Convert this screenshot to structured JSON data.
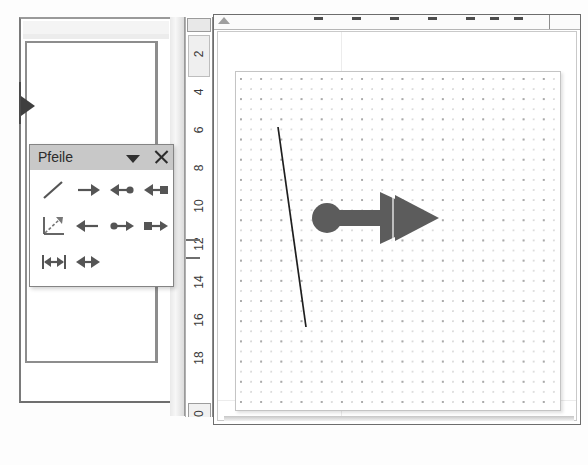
{
  "app": {
    "name": "drawing-application",
    "language": "de"
  },
  "toolbar": {
    "title": "Pfeile",
    "menu_icon": "chevron-down-icon",
    "close_icon": "close-icon",
    "rows": [
      [
        {
          "name": "line",
          "label": "Linie",
          "icon": "line-icon"
        },
        {
          "name": "arrow-right",
          "label": "Pfeil rechts",
          "icon": "arrow-right-icon"
        },
        {
          "name": "arrow-left-circle",
          "label": "Pfeil links mit Kreis",
          "icon": "arrow-left-circle-icon"
        },
        {
          "name": "arrow-left-square",
          "label": "Pfeil links mit Quadrat",
          "icon": "arrow-left-square-icon"
        }
      ],
      [
        {
          "name": "dimension-axis-arrow",
          "label": "Masslinie",
          "icon": "axis-arrow-icon"
        },
        {
          "name": "arrow-left",
          "label": "Pfeil links",
          "icon": "arrow-left-icon"
        },
        {
          "name": "arrow-double-circle",
          "label": "Doppelpfeil mit Kreis",
          "icon": "arrow-double-circle-icon"
        },
        {
          "name": "arrow-square-right",
          "label": "Pfeil mit Quadrat rechts",
          "icon": "arrow-square-right-icon"
        }
      ],
      [
        {
          "name": "dimension-line",
          "label": "Masspfeil",
          "icon": "dimension-line-icon"
        },
        {
          "name": "arrow-double",
          "label": "Doppelpfeil",
          "icon": "arrow-double-icon"
        }
      ]
    ]
  },
  "vertical_ruler": {
    "name": "vertical-ruler",
    "ticks": [
      "2",
      "4",
      "6",
      "8",
      "10",
      "12",
      "14",
      "16",
      "18",
      "20"
    ],
    "highlighted_tick": "20"
  },
  "horizontal_ruler": {
    "name": "horizontal-ruler",
    "indent_marker": "indent-marker"
  },
  "canvas": {
    "name": "drawing-canvas",
    "grid": "dot-grid",
    "shapes": [
      {
        "name": "diagonal-line",
        "type": "line",
        "x1": 42,
        "y1": 55,
        "x2": 70,
        "y2": 255,
        "stroke": "#1f1f1f",
        "width": 1.6
      },
      {
        "name": "block-arrow",
        "type": "arrow-with-circle-tail",
        "fill": "#5c5c5c",
        "circle_cx": 91,
        "circle_cy": 146,
        "circle_r": 14,
        "shaft_x": 100,
        "shaft_y": 139,
        "shaft_w": 48,
        "shaft_h": 15,
        "head_points": "144,122 144,170 196,146",
        "head2_points": "158,124 158,168 200,146"
      }
    ]
  },
  "left_window": {
    "name": "background-document-window",
    "pointer_icon": "play-triangle-icon"
  },
  "colors": {
    "toolbar_title_bg": "#c8c8c8",
    "shape_fill": "#5c5c5c",
    "grid_dot_major": "#a9a9a9",
    "grid_dot_minor": "#d9d9d9",
    "window_border": "#6d6d6d"
  }
}
